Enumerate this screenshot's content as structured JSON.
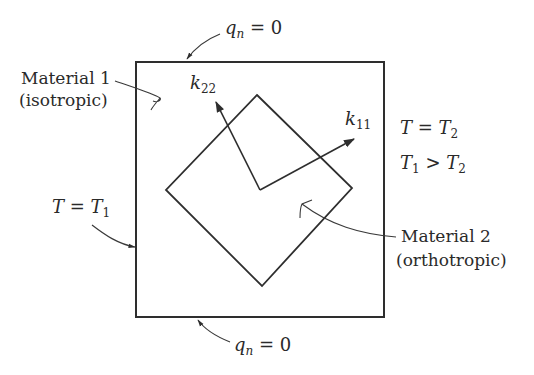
{
  "diagram": {
    "colors": {
      "line": "#2e2e2e",
      "text": "#2a2a2a",
      "background": "#ffffff"
    },
    "outer_square": {
      "x": 136,
      "y": 62,
      "width": 248,
      "height": 255
    },
    "inner_diamond": {
      "points": [
        [
          257,
          95
        ],
        [
          352,
          188
        ],
        [
          262,
          286
        ],
        [
          166,
          190
        ]
      ]
    },
    "axes_origin": [
      260,
      190
    ],
    "labels": {
      "top_flux": {
        "var": "q",
        "sub": "n",
        "rel": " = ",
        "val": "0"
      },
      "bottom_flux": {
        "var": "q",
        "sub": "n",
        "rel": " = ",
        "val": "0"
      },
      "material1_line1": "Material 1",
      "material1_line2": "(isotropic)",
      "k22": {
        "var": "k",
        "sub": "22"
      },
      "k11": {
        "var": "k",
        "sub": "11"
      },
      "right_bc": {
        "lhs": "T",
        "rel": " = ",
        "rhs": "T",
        "rhs_sub": "2"
      },
      "inequality": {
        "lhs": "T",
        "lhs_sub": "1",
        "rel": " > ",
        "rhs": "T",
        "rhs_sub": "2"
      },
      "left_bc": {
        "lhs": "T",
        "rel": " = ",
        "rhs": "T",
        "rhs_sub": "1"
      },
      "material2_line1": "Material 2",
      "material2_line2": "(orthotropic)"
    }
  }
}
